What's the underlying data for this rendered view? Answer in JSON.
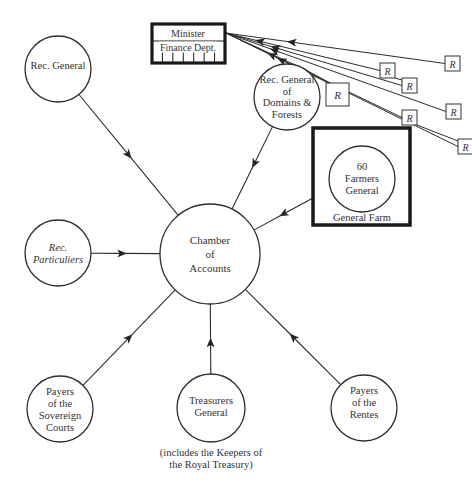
{
  "diagram": {
    "title": "",
    "colors": {
      "line": "#2e2e2e",
      "thick_border": "#1a1a1a",
      "text": "#333333",
      "background": "#ffffff"
    },
    "center_node": {
      "id": "chamber",
      "lines": [
        "Chamber",
        "of",
        "Accounts"
      ],
      "cx": 210,
      "cy": 254,
      "r": 50
    },
    "nodes": [
      {
        "id": "rec-general",
        "lines": [
          "Rec. General"
        ],
        "cx": 58,
        "cy": 69,
        "r": 33,
        "italic": false,
        "arrow_to_center": true
      },
      {
        "id": "rec-particuliers",
        "lines": [
          "Rec.",
          "Particuliers"
        ],
        "cx": 58,
        "cy": 253,
        "r": 33,
        "italic": true,
        "arrow_to_center": true
      },
      {
        "id": "payers-sovereign-courts",
        "lines": [
          "Payers",
          "of the",
          "Sovereign",
          "Courts"
        ],
        "cx": 60,
        "cy": 409,
        "r": 33,
        "italic": false,
        "arrow_to_center": true
      },
      {
        "id": "treasurers-general",
        "lines": [
          "Treasurers",
          "General"
        ],
        "cx": 211,
        "cy": 408,
        "r": 34,
        "italic": false,
        "arrow_to_center": true
      },
      {
        "id": "payers-rentes",
        "lines": [
          "Payers",
          "of the",
          "Rentes"
        ],
        "cx": 364,
        "cy": 408,
        "r": 33,
        "italic": false,
        "arrow_to_center": true
      },
      {
        "id": "rec-general-domains-forests",
        "lines": [
          "Rec. General",
          "of",
          "Domains &",
          "Forests"
        ],
        "cx": 287,
        "cy": 97,
        "r": 33,
        "italic": false,
        "arrow_to_center": true
      }
    ],
    "treasurers_caption": [
      "(includes the Keepers of",
      "the Royal Treasury)"
    ],
    "general_farm": {
      "box_label": "General Farm",
      "x": 313,
      "y": 128,
      "w": 97,
      "h": 97,
      "inner": {
        "lines": [
          "60",
          "Farmers",
          "General"
        ],
        "cx": 362,
        "cy": 179,
        "r": 33
      }
    },
    "minister_box": {
      "top_label": "Minister",
      "bottom_label": "Finance Dept.",
      "x": 152,
      "y": 24,
      "w": 73,
      "h": 39
    },
    "r_boxes": [
      {
        "label": "R",
        "x": 326,
        "y": 83,
        "w": 23,
        "h": 23
      },
      {
        "label": "R",
        "x": 380,
        "y": 63,
        "w": 15,
        "h": 15
      },
      {
        "label": "R",
        "x": 402,
        "y": 78,
        "w": 15,
        "h": 15
      },
      {
        "label": "R",
        "x": 445,
        "y": 56,
        "w": 15,
        "h": 15
      },
      {
        "label": "R",
        "x": 446,
        "y": 104,
        "w": 15,
        "h": 15
      },
      {
        "label": "R",
        "x": 402,
        "y": 110,
        "w": 15,
        "h": 15
      },
      {
        "label": "R",
        "x": 458,
        "y": 139,
        "w": 15,
        "h": 15
      }
    ]
  }
}
